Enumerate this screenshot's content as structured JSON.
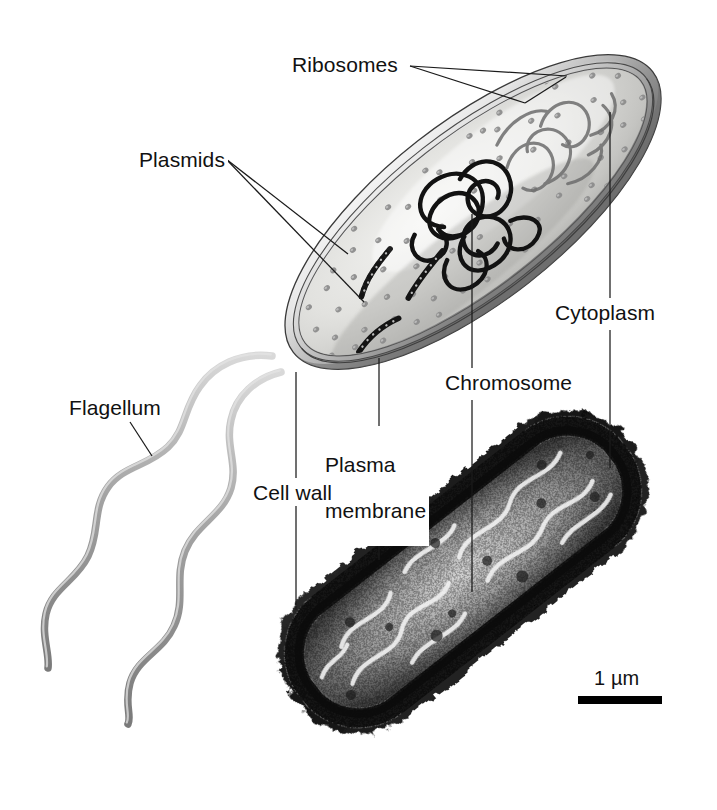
{
  "figure": {
    "type": "labeled-biology-diagram",
    "panels": [
      {
        "name": "illustration",
        "description": "cutaway artist illustration of a rod-shaped bacterium with two flagella"
      },
      {
        "name": "micrograph",
        "description": "black and white transmission electron micrograph of a rod-shaped bacterium"
      }
    ],
    "background_color": "#ffffff",
    "line_color": "#1a1a1a",
    "text_color": "#111111"
  },
  "labels": {
    "ribosomes": "Ribosomes",
    "plasmids": "Plasmids",
    "cytoplasm": "Cytoplasm",
    "chromosome": "Chromosome",
    "plasma_membrane": "Plasma\nmembrane",
    "plasma_membrane_line1": "Plasma",
    "plasma_membrane_line2": "membrane",
    "cell_wall": "Cell wall",
    "flagellum": "Flagellum"
  },
  "scale_bar": {
    "value": "1",
    "unit": "µm",
    "text": "1 µm",
    "bar_length_px": 84,
    "bar_color": "#000000"
  },
  "callouts": [
    {
      "label": "Ribosomes",
      "targets": 2,
      "target_panel": "illustration"
    },
    {
      "label": "Plasmids",
      "targets": 2,
      "target_panel": "illustration"
    },
    {
      "label": "Cytoplasm",
      "targets": 2,
      "target_panel": "both"
    },
    {
      "label": "Chromosome",
      "targets": 2,
      "target_panel": "both"
    },
    {
      "label": "Plasma membrane",
      "targets": 2,
      "target_panel": "both"
    },
    {
      "label": "Cell wall",
      "targets": 2,
      "target_panel": "both"
    },
    {
      "label": "Flagellum",
      "targets": 1,
      "target_panel": "illustration"
    }
  ]
}
